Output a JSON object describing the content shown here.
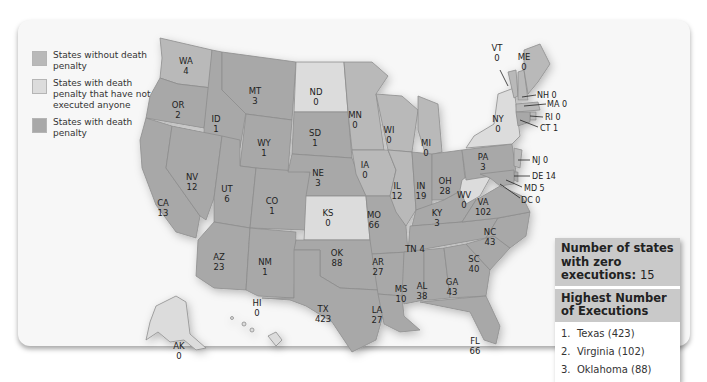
{
  "legend": {
    "items": [
      {
        "label": "States without death penalty",
        "color": "#b9b9b9"
      },
      {
        "label": "States with death penalty that have not executed anyone",
        "color": "#dcdcdc"
      },
      {
        "label": "States with death penalty",
        "color": "#a8a8a8"
      }
    ]
  },
  "states": {
    "WA": {
      "abbr": "WA",
      "value": "4"
    },
    "OR": {
      "abbr": "OR",
      "value": "2"
    },
    "CA": {
      "abbr": "CA",
      "value": "13"
    },
    "ID": {
      "abbr": "ID",
      "value": "1"
    },
    "NV": {
      "abbr": "NV",
      "value": "12"
    },
    "MT": {
      "abbr": "MT",
      "value": "3"
    },
    "WY": {
      "abbr": "WY",
      "value": "1"
    },
    "UT": {
      "abbr": "UT",
      "value": "6"
    },
    "AZ": {
      "abbr": "AZ",
      "value": "23"
    },
    "CO": {
      "abbr": "CO",
      "value": "1"
    },
    "NM": {
      "abbr": "NM",
      "value": "1"
    },
    "ND": {
      "abbr": "ND",
      "value": "0"
    },
    "SD": {
      "abbr": "SD",
      "value": "1"
    },
    "NE": {
      "abbr": "NE",
      "value": "3"
    },
    "KS": {
      "abbr": "KS",
      "value": "0"
    },
    "OK": {
      "abbr": "OK",
      "value": "88"
    },
    "TX": {
      "abbr": "TX",
      "value": "423"
    },
    "MN": {
      "abbr": "MN",
      "value": "0"
    },
    "IA": {
      "abbr": "IA",
      "value": "0"
    },
    "MO": {
      "abbr": "MO",
      "value": "66"
    },
    "AR": {
      "abbr": "AR",
      "value": "27"
    },
    "LA": {
      "abbr": "LA",
      "value": "27"
    },
    "WI": {
      "abbr": "WI",
      "value": "0"
    },
    "IL": {
      "abbr": "IL",
      "value": "12"
    },
    "MI": {
      "abbr": "MI",
      "value": "0"
    },
    "IN": {
      "abbr": "IN",
      "value": "19"
    },
    "OH": {
      "abbr": "OH",
      "value": "28"
    },
    "KY": {
      "abbr": "KY",
      "value": "3"
    },
    "TN": {
      "abbr": "TN",
      "value": "4"
    },
    "MS": {
      "abbr": "MS",
      "value": "10"
    },
    "AL": {
      "abbr": "AL",
      "value": "38"
    },
    "GA": {
      "abbr": "GA",
      "value": "43"
    },
    "FL": {
      "abbr": "FL",
      "value": "66"
    },
    "SC": {
      "abbr": "SC",
      "value": "40"
    },
    "NC": {
      "abbr": "NC",
      "value": "43"
    },
    "VA": {
      "abbr": "VA",
      "value": "102"
    },
    "WV": {
      "abbr": "WV",
      "value": "0"
    },
    "PA": {
      "abbr": "PA",
      "value": "3"
    },
    "NY": {
      "abbr": "NY",
      "value": "0"
    },
    "VT": {
      "abbr": "VT",
      "value": "0"
    },
    "ME": {
      "abbr": "ME",
      "value": "0"
    },
    "NH": {
      "abbr": "NH",
      "value": "0"
    },
    "MA": {
      "abbr": "MA",
      "value": "0"
    },
    "RI": {
      "abbr": "RI",
      "value": "0"
    },
    "CT": {
      "abbr": "CT",
      "value": "1"
    },
    "NJ": {
      "abbr": "NJ",
      "value": "0"
    },
    "DE": {
      "abbr": "DE",
      "value": "14"
    },
    "MD": {
      "abbr": "MD",
      "value": "5"
    },
    "DC": {
      "abbr": "DC",
      "value": "0"
    },
    "AK": {
      "abbr": "AK",
      "value": "0"
    },
    "HI": {
      "abbr": "HI",
      "value": "0"
    }
  },
  "callouts": {
    "TN": "TN 4",
    "NH": "NH 0",
    "MA": "MA 0",
    "RI": "RI 0",
    "CT": "CT 1",
    "NJ": "NJ 0",
    "DE": "DE 14",
    "MD": "MD 5",
    "DC": "DC 0"
  },
  "summary": {
    "zero_label": "Number of states with zero executions:",
    "zero_count": "15",
    "highest_title": "Highest Number of Executions",
    "highest": [
      {
        "rank": "1.",
        "text": "Texas (423)"
      },
      {
        "rank": "2.",
        "text": "Virginia (102)"
      },
      {
        "rank": "3.",
        "text": "Oklahoma (88)"
      }
    ]
  }
}
